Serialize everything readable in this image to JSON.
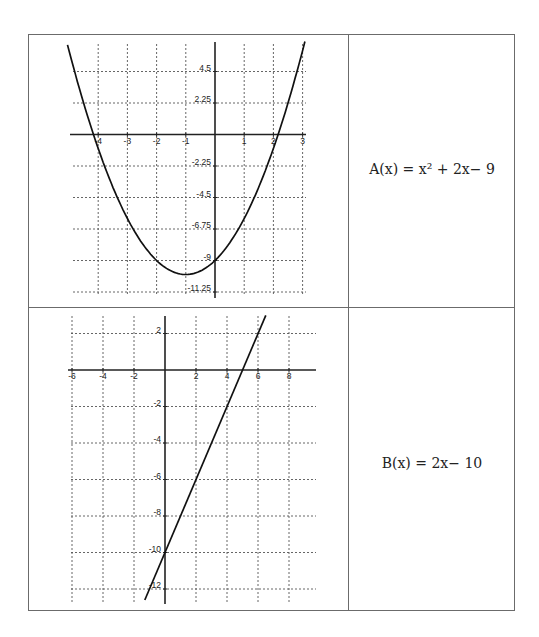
{
  "table": {
    "rows": [
      {
        "formula_label": "A(x) = x² + 2x− 9"
      },
      {
        "formula_label": "B(x) = 2x− 10"
      }
    ]
  },
  "chart_data": [
    {
      "type": "line",
      "title": "",
      "function": "A(x) = x^2 + 2x - 9",
      "xlabel": "",
      "ylabel": "",
      "xlim": [
        -5,
        3
      ],
      "ylim": [
        -11.25,
        6.6
      ],
      "grid": true,
      "x_ticks": [
        -4,
        -3,
        -2,
        -1,
        1,
        2,
        3
      ],
      "x_tick_labels": [
        "-4",
        "-3",
        "-2",
        "-1",
        "1",
        "2",
        "3"
      ],
      "y_ticks": [
        4.5,
        2.25,
        -2.25,
        -4.5,
        -6.75,
        -9,
        -11.25
      ],
      "y_tick_labels": [
        "4.5",
        "2.25",
        "-2.25",
        "-4.5",
        "-6.75",
        "-9",
        "-11.25"
      ],
      "x": [
        -5,
        -4.5,
        -4,
        -3.5,
        -3,
        -2.5,
        -2,
        -1.5,
        -1,
        -0.5,
        0,
        0.5,
        1,
        1.5,
        2,
        2.5,
        3
      ],
      "y": [
        6,
        2.25,
        -1,
        -3.75,
        -6,
        -7.75,
        -9,
        -9.75,
        -10,
        -9.75,
        -9,
        -7.75,
        -6,
        -3.75,
        -1,
        2.25,
        6
      ],
      "vertex": [
        -1,
        -10
      ],
      "roots": [
        -4.16,
        2.16
      ],
      "y_intercept": -9
    },
    {
      "type": "line",
      "title": "",
      "function": "B(x) = 2x - 10",
      "xlabel": "",
      "ylabel": "",
      "xlim": [
        -6,
        9.8
      ],
      "ylim": [
        -12.7,
        3
      ],
      "grid": true,
      "x_ticks": [
        -6,
        -4,
        -2,
        2,
        4,
        6,
        8
      ],
      "x_tick_labels": [
        "-6",
        "-4",
        "-2",
        "2",
        "4",
        "6",
        "8"
      ],
      "y_ticks": [
        2,
        -2,
        -4,
        -6,
        -8,
        -10,
        -12
      ],
      "y_tick_labels": [
        "2",
        "-2",
        "-4",
        "-6",
        "-8",
        "-10",
        "-12"
      ],
      "x": [
        -1.3,
        6.5
      ],
      "y": [
        -12.6,
        3
      ],
      "slope": 2,
      "y_intercept": -10,
      "root": 5
    }
  ]
}
